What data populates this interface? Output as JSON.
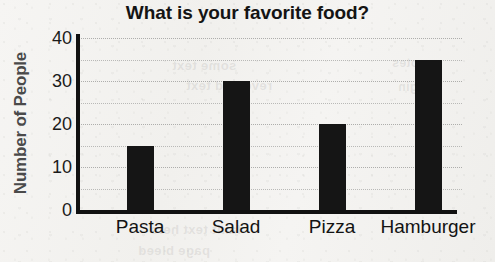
{
  "chart_data": {
    "type": "bar",
    "title": "What is your favorite food?",
    "xlabel": "",
    "ylabel": "Number of People",
    "categories": [
      "Pasta",
      "Salad",
      "Pizza",
      "Hamburger"
    ],
    "values": [
      15,
      30,
      20,
      35
    ],
    "ylim": [
      0,
      40
    ],
    "ytick_labels": [
      "0",
      "10",
      "20",
      "30",
      "40"
    ],
    "ytick_values": [
      0,
      10,
      20,
      30,
      40
    ],
    "gridlines": {
      "visible": true,
      "axis": "y",
      "style": "dotted",
      "interval": 5,
      "values": [
        5,
        10,
        15,
        20,
        25,
        30,
        35,
        40
      ],
      "color": "#b9b9b7"
    },
    "legend": null,
    "bar_color": "#151515",
    "axis_color": "#111111",
    "title_color": "#141414",
    "ylabel_color": "#4a4a4a",
    "background_color": "#f4f3f1"
  },
  "bleed_through": {
    "line1": "some text",
    "line2": "reversed text",
    "line3": "faint text here",
    "line4": "page bleed",
    "line5": "notes",
    "line6": "margin"
  }
}
